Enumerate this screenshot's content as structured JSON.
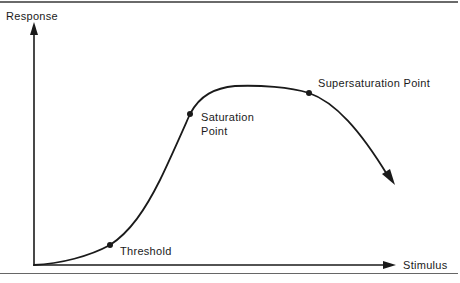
{
  "diagram": {
    "axes": {
      "y_label": "Response",
      "x_label": "Stimulus"
    },
    "points": [
      {
        "name": "threshold",
        "label": "Threshold",
        "x": 110,
        "y": 245
      },
      {
        "name": "saturation",
        "label_line1": "Saturation",
        "label_line2": "Point",
        "x": 190,
        "y": 114
      },
      {
        "name": "supersaturation",
        "label": "Supersaturation Point",
        "x": 309,
        "y": 93
      }
    ],
    "colors": {
      "ink": "#1a1a1a",
      "rule": "#666666",
      "background": "#ffffff"
    }
  }
}
